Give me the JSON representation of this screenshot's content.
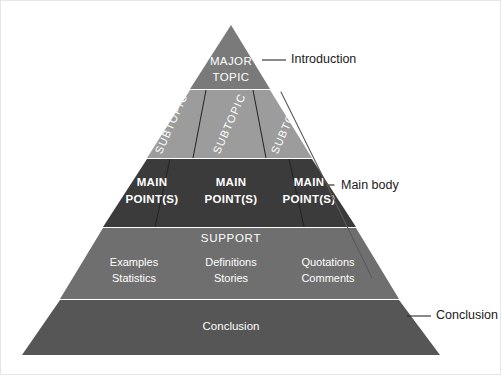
{
  "diagram": {
    "apex": {
      "label_line1": "MAJOR",
      "label_line2": "TOPIC"
    },
    "subtopics": [
      {
        "label": "SUBTOPIC"
      },
      {
        "label": "SUBTOPIC"
      },
      {
        "label": "SUBTOPIC"
      }
    ],
    "main_points": [
      {
        "line1": "MAIN",
        "line2": "POINT(S)"
      },
      {
        "line1": "MAIN",
        "line2": "POINT(S)"
      },
      {
        "line1": "MAIN",
        "line2": "POINT(S)"
      }
    ],
    "support": {
      "heading": "SUPPORT",
      "columns": [
        {
          "line1": "Examples",
          "line2": "Statistics"
        },
        {
          "line1": "Definitions",
          "line2": "Stories"
        },
        {
          "line1": "Quotations",
          "line2": "Comments"
        }
      ]
    },
    "conclusion": {
      "label": "Conclusion"
    },
    "callouts": [
      {
        "label": "Introduction"
      },
      {
        "label": "Main body"
      },
      {
        "label": "Conclusion"
      }
    ],
    "colors": {
      "apex": "#7a7a7a",
      "subtopic": "#9c9c9c",
      "main_points": "#3b3b3b",
      "support": "#6f6f6f",
      "conclusion": "#565656",
      "text_light": "#ffffff",
      "text_dark": "#1a1a1a",
      "background": "#ffffff",
      "frame": "#e6e6e6"
    }
  }
}
